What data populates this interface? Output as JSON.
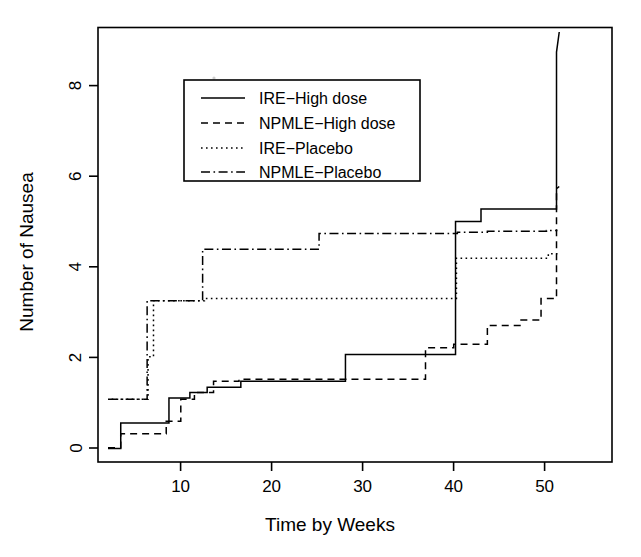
{
  "chart_data": {
    "type": "line",
    "title": "",
    "xlabel": "Time by Weeks",
    "ylabel": "Number of Nausea",
    "xlim": [
      1.5,
      58
    ],
    "ylim": [
      -0.25,
      9.45
    ],
    "xticks": [
      10,
      20,
      30,
      40,
      50
    ],
    "yticks": [
      0,
      2,
      4,
      6,
      8
    ],
    "grid": false,
    "legend_position": "top-center",
    "step_type": "post",
    "series": [
      {
        "name": "IRE−High dose",
        "linestyle": "solid",
        "x": [
          2.6,
          4.0,
          4.0,
          9.3,
          9.3,
          11.6,
          11.6,
          13.5,
          13.5,
          17.2,
          17.2,
          28.7,
          28.7,
          40.8,
          40.8,
          43.6,
          43.6,
          51.9,
          51.9,
          52.2
        ],
        "y": [
          0.05,
          0.05,
          0.62,
          0.62,
          1.18,
          1.18,
          1.3,
          1.3,
          1.42,
          1.42,
          1.55,
          1.55,
          2.15,
          2.15,
          5.12,
          5.12,
          5.4,
          5.4,
          8.9,
          9.35
        ]
      },
      {
        "name": "NPMLE−High dose",
        "linestyle": "dashed",
        "x": [
          2.6,
          4.0,
          4.0,
          9.0,
          9.0,
          10.6,
          10.6,
          12.1,
          12.1,
          14.2,
          14.2,
          17.0,
          17.0,
          37.5,
          37.5,
          40.6,
          40.6,
          44.3,
          44.3,
          48.0,
          48.0,
          50.2,
          50.2,
          51.9,
          51.9,
          52.2
        ],
        "y": [
          0.07,
          0.07,
          0.38,
          0.38,
          0.66,
          0.66,
          1.15,
          1.15,
          1.3,
          1.3,
          1.55,
          1.55,
          1.6,
          1.6,
          2.3,
          2.3,
          2.38,
          2.38,
          2.8,
          2.8,
          2.92,
          2.92,
          3.4,
          3.4,
          5.85,
          5.9
        ]
      },
      {
        "name": "IRE−Placebo",
        "linestyle": "dotted",
        "x": [
          3.0,
          7.0,
          7.0,
          7.6,
          7.6,
          13.2,
          13.2,
          40.9,
          40.9,
          51.0,
          51.0,
          52.0
        ],
        "y": [
          1.15,
          1.15,
          2.1,
          2.1,
          3.35,
          3.35,
          3.4,
          3.4,
          4.3,
          4.3,
          4.4,
          4.4
        ]
      },
      {
        "name": "NPMLE−Placebo",
        "linestyle": "dashdot",
        "x": [
          2.6,
          6.9,
          6.9,
          13.0,
          13.0,
          25.8,
          25.8,
          41.0,
          41.0,
          44.3,
          44.3,
          50.8,
          50.8,
          52.0
        ],
        "y": [
          1.15,
          1.15,
          3.35,
          3.35,
          4.5,
          4.5,
          4.85,
          4.85,
          4.88,
          4.88,
          4.9,
          4.9,
          4.92,
          4.92
        ]
      }
    ]
  },
  "legend": {
    "entries": [
      {
        "label": "IRE−High dose",
        "linestyle": "solid"
      },
      {
        "label": "NPMLE−High dose",
        "linestyle": "dashed"
      },
      {
        "label": "IRE−Placebo",
        "linestyle": "dotted"
      },
      {
        "label": "NPMLE−Placebo",
        "linestyle": "dashdot"
      }
    ]
  },
  "colors": {
    "ink": "#000000",
    "background": "#ffffff"
  }
}
